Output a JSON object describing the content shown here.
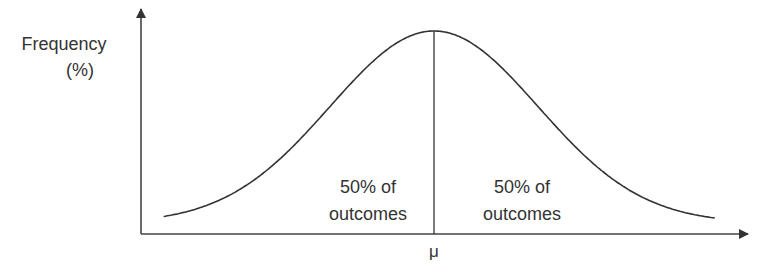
{
  "chart_data": {
    "type": "line",
    "title": "",
    "distribution": "normal",
    "ylabel_lines": [
      "Frequency",
      "(%)"
    ],
    "xlabel": "",
    "x_tick_labels": [
      "μ"
    ],
    "mean_label": "μ",
    "regions": [
      {
        "side": "left",
        "lines": [
          "50% of",
          "outcomes"
        ],
        "share_percent": 50
      },
      {
        "side": "right",
        "lines": [
          "50% of",
          "outcomes"
        ],
        "share_percent": 50
      }
    ],
    "series": [
      {
        "name": "normal distribution",
        "mean": 0,
        "sd": 1,
        "x_range_sd": [
          -2.6,
          2.7
        ]
      }
    ],
    "grid": false,
    "legend": "none",
    "colors": {
      "line": "#333333",
      "text": "#333333"
    }
  }
}
